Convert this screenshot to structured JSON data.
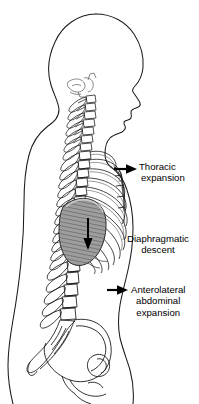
{
  "figure": {
    "background_color": "#ffffff",
    "line_color": "#1a1a1a",
    "diaphragm_fill_color": "#9b9b9b",
    "arrow_color": "#000000"
  },
  "labels": {
    "thoracic": {
      "line1": "Thoracic",
      "line2": "expansion"
    },
    "diaphragmatic": {
      "line1": "Diaphragmatic",
      "line2": "descent"
    },
    "anterolateral": {
      "line1": "Anterolateral",
      "line2": "abdominal",
      "line3": "expansion"
    }
  },
  "arrows": [
    {
      "name": "thoracic-expansion-arrow",
      "direction": "right",
      "points_to": "rib cage"
    },
    {
      "name": "diaphragmatic-descent-arrow",
      "direction": "down",
      "points_to": "diaphragm"
    },
    {
      "name": "anterolateral-abdominal-expansion-arrow",
      "direction": "right",
      "points_to": "abdominal wall"
    }
  ],
  "anatomy": {
    "parts": [
      "head",
      "face-profile",
      "neck",
      "cervical-spine",
      "thoracic-spine",
      "lumbar-spine",
      "sacrum",
      "rib-cage",
      "sternum",
      "diaphragm",
      "pelvis",
      "body-outline"
    ]
  }
}
